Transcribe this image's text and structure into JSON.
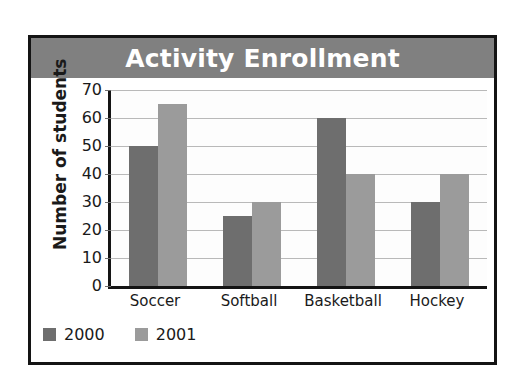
{
  "chart_data": {
    "type": "bar",
    "title": "Activity Enrollment",
    "xlabel": "",
    "ylabel": "Number of students",
    "categories": [
      "Soccer",
      "Softball",
      "Basketball",
      "Hockey"
    ],
    "series": [
      {
        "name": "2000",
        "color": "#6e6e6e",
        "values": [
          50,
          25,
          60,
          30
        ]
      },
      {
        "name": "2001",
        "color": "#9b9b9b",
        "values": [
          65,
          30,
          40,
          40
        ]
      }
    ],
    "ylim": [
      0,
      70
    ],
    "ytick_labels": [
      "0",
      "10",
      "20",
      "30",
      "40",
      "50",
      "60",
      "70"
    ],
    "ytick_values": [
      0,
      10,
      20,
      30,
      40,
      50,
      60,
      70
    ],
    "grid": true,
    "legend_position": "bottom-left",
    "title_banner_color": "#808080",
    "title_text_color": "#ffffff",
    "plot_background": "#fdfdfd",
    "frame_color": "#141414"
  },
  "legend": {
    "items": [
      {
        "label": "2000"
      },
      {
        "label": "2001"
      }
    ]
  }
}
